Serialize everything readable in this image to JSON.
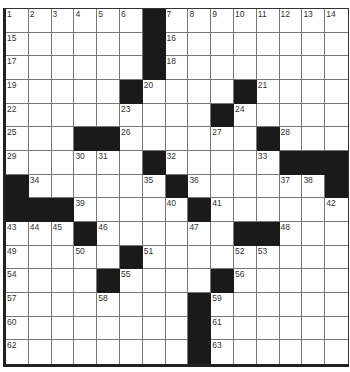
{
  "puzzle": {
    "rows": 15,
    "cols": 15,
    "black_cells": [
      [
        0,
        6
      ],
      [
        1,
        6
      ],
      [
        2,
        6
      ],
      [
        3,
        5
      ],
      [
        3,
        10
      ],
      [
        4,
        9
      ],
      [
        5,
        3
      ],
      [
        5,
        4
      ],
      [
        5,
        11
      ],
      [
        6,
        6
      ],
      [
        6,
        12
      ],
      [
        6,
        13
      ],
      [
        6,
        14
      ],
      [
        7,
        0
      ],
      [
        7,
        7
      ],
      [
        7,
        14
      ],
      [
        8,
        0
      ],
      [
        8,
        1
      ],
      [
        8,
        2
      ],
      [
        8,
        8
      ],
      [
        9,
        3
      ],
      [
        9,
        10
      ],
      [
        9,
        11
      ],
      [
        10,
        5
      ],
      [
        11,
        4
      ],
      [
        11,
        9
      ],
      [
        12,
        8
      ],
      [
        13,
        8
      ],
      [
        14,
        8
      ]
    ],
    "numbers": [
      {
        "r": 0,
        "c": 0,
        "n": "1"
      },
      {
        "r": 0,
        "c": 1,
        "n": "2"
      },
      {
        "r": 0,
        "c": 2,
        "n": "3"
      },
      {
        "r": 0,
        "c": 3,
        "n": "4"
      },
      {
        "r": 0,
        "c": 4,
        "n": "5"
      },
      {
        "r": 0,
        "c": 5,
        "n": "6"
      },
      {
        "r": 0,
        "c": 7,
        "n": "7"
      },
      {
        "r": 0,
        "c": 8,
        "n": "8"
      },
      {
        "r": 0,
        "c": 9,
        "n": "9"
      },
      {
        "r": 0,
        "c": 10,
        "n": "10"
      },
      {
        "r": 0,
        "c": 11,
        "n": "11"
      },
      {
        "r": 0,
        "c": 12,
        "n": "12"
      },
      {
        "r": 0,
        "c": 13,
        "n": "13"
      },
      {
        "r": 0,
        "c": 14,
        "n": "14"
      },
      {
        "r": 1,
        "c": 0,
        "n": "15"
      },
      {
        "r": 1,
        "c": 7,
        "n": "16"
      },
      {
        "r": 2,
        "c": 0,
        "n": "17"
      },
      {
        "r": 2,
        "c": 7,
        "n": "18"
      },
      {
        "r": 3,
        "c": 0,
        "n": "19"
      },
      {
        "r": 3,
        "c": 6,
        "n": "20"
      },
      {
        "r": 3,
        "c": 11,
        "n": "21"
      },
      {
        "r": 4,
        "c": 0,
        "n": "22"
      },
      {
        "r": 4,
        "c": 5,
        "n": "23"
      },
      {
        "r": 4,
        "c": 10,
        "n": "24"
      },
      {
        "r": 5,
        "c": 0,
        "n": "25"
      },
      {
        "r": 5,
        "c": 5,
        "n": "26"
      },
      {
        "r": 5,
        "c": 9,
        "n": "27"
      },
      {
        "r": 5,
        "c": 12,
        "n": "28"
      },
      {
        "r": 6,
        "c": 0,
        "n": "29"
      },
      {
        "r": 6,
        "c": 3,
        "n": "30"
      },
      {
        "r": 6,
        "c": 4,
        "n": "31"
      },
      {
        "r": 6,
        "c": 7,
        "n": "32"
      },
      {
        "r": 6,
        "c": 11,
        "n": "33"
      },
      {
        "r": 7,
        "c": 1,
        "n": "34"
      },
      {
        "r": 7,
        "c": 6,
        "n": "35"
      },
      {
        "r": 7,
        "c": 8,
        "n": "36"
      },
      {
        "r": 7,
        "c": 12,
        "n": "37"
      },
      {
        "r": 7,
        "c": 13,
        "n": "38"
      },
      {
        "r": 8,
        "c": 3,
        "n": "39"
      },
      {
        "r": 8,
        "c": 7,
        "n": "40"
      },
      {
        "r": 8,
        "c": 9,
        "n": "41"
      },
      {
        "r": 8,
        "c": 14,
        "n": "42"
      },
      {
        "r": 9,
        "c": 0,
        "n": "43"
      },
      {
        "r": 9,
        "c": 1,
        "n": "44"
      },
      {
        "r": 9,
        "c": 2,
        "n": "45"
      },
      {
        "r": 9,
        "c": 4,
        "n": "46"
      },
      {
        "r": 9,
        "c": 8,
        "n": "47"
      },
      {
        "r": 9,
        "c": 12,
        "n": "48"
      },
      {
        "r": 10,
        "c": 0,
        "n": "49"
      },
      {
        "r": 10,
        "c": 3,
        "n": "50"
      },
      {
        "r": 10,
        "c": 6,
        "n": "51"
      },
      {
        "r": 10,
        "c": 10,
        "n": "52"
      },
      {
        "r": 10,
        "c": 11,
        "n": "53"
      },
      {
        "r": 11,
        "c": 0,
        "n": "54"
      },
      {
        "r": 11,
        "c": 5,
        "n": "55"
      },
      {
        "r": 11,
        "c": 10,
        "n": "56"
      },
      {
        "r": 12,
        "c": 0,
        "n": "57"
      },
      {
        "r": 12,
        "c": 4,
        "n": "58"
      },
      {
        "r": 12,
        "c": 9,
        "n": "59"
      },
      {
        "r": 13,
        "c": 0,
        "n": "60"
      },
      {
        "r": 13,
        "c": 9,
        "n": "61"
      },
      {
        "r": 14,
        "c": 0,
        "n": "62"
      },
      {
        "r": 14,
        "c": 9,
        "n": "63"
      }
    ],
    "colors": {
      "black_square": "#1a1a1a",
      "white_square": "#ffffff",
      "grid_line": "#777777",
      "number_text": "#333333"
    }
  }
}
